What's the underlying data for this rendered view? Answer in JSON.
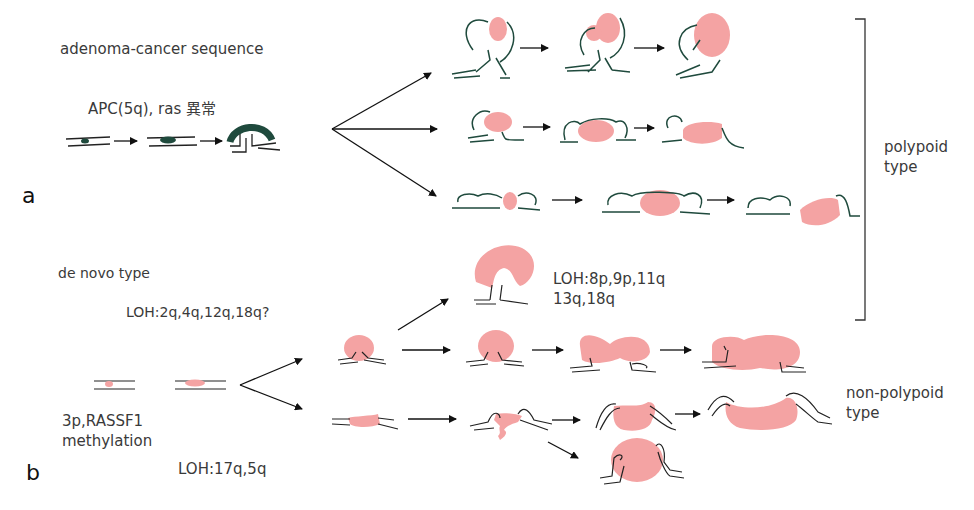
{
  "panels": {
    "a": {
      "label": "a",
      "title": "adenoma-cancer sequence",
      "genes": "APC(5q), ras 異常"
    },
    "b": {
      "label": "b",
      "title": "de novo type",
      "loh_early": "LOH:2q,4q,12q,18q?",
      "loh_polypoid": "LOH:8p,9p,11q",
      "loh_polypoid_2": "13q,18q",
      "initiation_1": "3p,RASSF1",
      "initiation_2": "methylation",
      "loh_late": "LOH:17q,5q"
    }
  },
  "types": {
    "polypoid": {
      "line1": "polypoid",
      "line2": "type"
    },
    "non_polypoid": {
      "line1": "non-polypoid",
      "line2": "type"
    }
  },
  "colors": {
    "adenoma": "#1f4a3d",
    "cancer": "#f4a3a3",
    "mucosa_line": "#222222",
    "arrow": "#111111"
  }
}
